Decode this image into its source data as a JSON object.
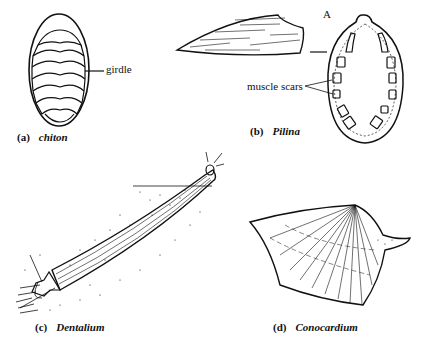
{
  "figure": {
    "panels": [
      {
        "id": "a",
        "letter": "(a)",
        "name": "chiton",
        "labels": [
          "girdle"
        ]
      },
      {
        "id": "b",
        "letter": "(b)",
        "name": "Pilina",
        "labels": [
          "A",
          "muscle scars"
        ]
      },
      {
        "id": "c",
        "letter": "(c)",
        "name": "Dentalium",
        "labels": []
      },
      {
        "id": "d",
        "letter": "(d)",
        "name": "Conocardium",
        "labels": []
      }
    ],
    "colors": {
      "ink": "#111111",
      "background": "#ffffff"
    }
  }
}
